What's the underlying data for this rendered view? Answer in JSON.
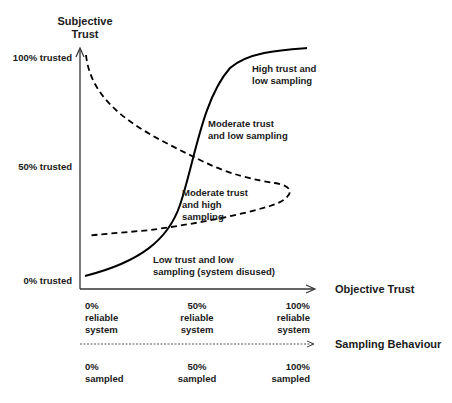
{
  "diagram": {
    "y_axis": {
      "title_line1": "Subjective",
      "title_line2": "Trust",
      "ticks": [
        "100% trusted",
        "50% trusted",
        "0% trusted"
      ]
    },
    "x_axis": {
      "title": "Objective Trust",
      "ticks": [
        "0%\nreliable\nsystem",
        "50%\nreliable\nsystem",
        "100%\nreliable\nsystem"
      ]
    },
    "sampling_axis": {
      "title": "Sampling Behaviour",
      "ticks": [
        "0%\nsampled",
        "50%\nsampled",
        "100%\nsampled"
      ]
    },
    "region_labels": {
      "high_trust": "High trust and\nlow sampling",
      "moderate_low": "Moderate trust\nand low sampling",
      "moderate_high": "Moderate trust\nand high\nsampling",
      "low_trust": "Low trust and low\nsampling (system disused)"
    },
    "curves": [
      {
        "name": "subjective-trust-curve",
        "style": "solid",
        "color": "#000000"
      },
      {
        "name": "sampling-behaviour-curve",
        "style": "dashed",
        "color": "#000000"
      }
    ]
  }
}
